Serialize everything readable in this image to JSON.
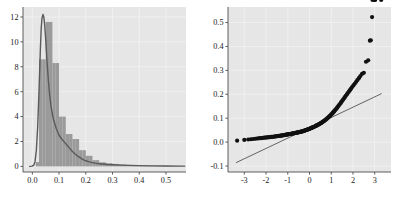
{
  "figure": {
    "background": "#ffffff",
    "panel_background": "#e6e6e6",
    "grid_color": "#f2f2f2",
    "axis_color": "#4d4d4d",
    "width": 394,
    "height": 200
  },
  "chart_data": [
    {
      "id": "density-histogram",
      "type": "area",
      "title": "",
      "xlabel": "",
      "ylabel": "",
      "xlim": [
        -0.035,
        0.575
      ],
      "ylim": [
        -0.45,
        12.8
      ],
      "xticks": [
        "0.0",
        "0.1",
        "0.2",
        "0.3",
        "0.4",
        "0.5"
      ],
      "xtick_values": [
        0.0,
        0.1,
        0.2,
        0.3,
        0.4,
        0.5
      ],
      "yticks": [
        "0",
        "2",
        "4",
        "6",
        "8",
        "10",
        "12"
      ],
      "ytick_values": [
        0,
        2,
        4,
        6,
        8,
        10,
        12
      ],
      "grid": true,
      "legend": "none",
      "series": [
        {
          "name": "histogram",
          "kind": "bar",
          "color": "#9a9a9a",
          "bin_width": 0.0125,
          "bin_left_edges": [
            0.0125,
            0.025,
            0.0375,
            0.05,
            0.0625,
            0.075,
            0.0875,
            0.1,
            0.1125,
            0.125,
            0.1375,
            0.15,
            0.1625,
            0.175,
            0.1875,
            0.2,
            0.2125,
            0.225,
            0.2375,
            0.25,
            0.2625,
            0.275,
            0.2875,
            0.3,
            0.3125,
            0.325,
            0.3375,
            0.35,
            0.3625,
            0.375,
            0.3875,
            0.4,
            0.4125,
            0.425,
            0.4375,
            0.45,
            0.4625,
            0.475,
            0.4875,
            0.5,
            0.5125,
            0.525,
            0.5375,
            0.55
          ],
          "values": [
            0.35,
            8.6,
            8.6,
            11.6,
            11.6,
            8.3,
            8.3,
            4.0,
            4.0,
            2.6,
            2.6,
            2.2,
            2.2,
            1.3,
            1.3,
            0.85,
            0.85,
            0.5,
            0.5,
            0.33,
            0.33,
            0.26,
            0.26,
            0.2,
            0.2,
            0.16,
            0.16,
            0.12,
            0.12,
            0.1,
            0.1,
            0.08,
            0.08,
            0.06,
            0.06,
            0.05,
            0.05,
            0.04,
            0.04,
            0.03,
            0.03,
            0.02,
            0.02,
            0.01
          ]
        },
        {
          "name": "kernel density",
          "kind": "line",
          "color": "#5a5a5a",
          "line_width": 1.4,
          "x": [
            -0.01,
            0.0,
            0.005,
            0.01,
            0.015,
            0.02,
            0.025,
            0.03,
            0.033,
            0.036,
            0.04,
            0.043,
            0.046,
            0.05,
            0.055,
            0.06,
            0.065,
            0.07,
            0.075,
            0.08,
            0.09,
            0.1,
            0.11,
            0.12,
            0.13,
            0.14,
            0.15,
            0.16,
            0.17,
            0.18,
            0.19,
            0.2,
            0.21,
            0.22,
            0.24,
            0.26,
            0.28,
            0.3,
            0.33,
            0.36,
            0.4,
            0.45,
            0.5,
            0.55,
            0.57
          ],
          "y": [
            0.0,
            0.02,
            0.1,
            0.38,
            1.3,
            3.2,
            6.1,
            9.4,
            11.0,
            11.9,
            12.2,
            12.0,
            11.4,
            10.2,
            8.4,
            6.9,
            5.7,
            4.8,
            4.2,
            3.7,
            3.0,
            2.5,
            2.2,
            1.95,
            1.7,
            1.45,
            1.2,
            1.0,
            0.82,
            0.68,
            0.55,
            0.45,
            0.38,
            0.32,
            0.24,
            0.19,
            0.15,
            0.13,
            0.1,
            0.08,
            0.06,
            0.04,
            0.03,
            0.02,
            0.02
          ]
        }
      ]
    },
    {
      "id": "normal-qq-plot",
      "type": "scatter",
      "title": "",
      "xlabel": "",
      "ylabel": "",
      "xlim": [
        -3.75,
        3.75
      ],
      "ylim": [
        -0.125,
        0.565
      ],
      "xticks": [
        "-3",
        "-2",
        "-1",
        "0",
        "1",
        "2",
        "3"
      ],
      "xtick_values": [
        -3,
        -2,
        -1,
        0,
        1,
        2,
        3
      ],
      "yticks": [
        "-0.1",
        "0.0",
        "0.1",
        "0.2",
        "0.3",
        "0.4",
        "0.5"
      ],
      "ytick_values": [
        -0.1,
        0.0,
        0.1,
        0.2,
        0.3,
        0.4,
        0.5
      ],
      "grid": true,
      "legend": "none",
      "point_color": "#111111",
      "point_size": 2.1,
      "reference_line": {
        "name": "qq reference line",
        "color": "#555555",
        "line_width": 0.9,
        "x": [
          -3.38,
          3.32
        ],
        "y": [
          -0.086,
          0.203
        ]
      },
      "points": {
        "x": [
          -3.33,
          -3.0,
          -2.82,
          -2.7,
          -2.6,
          -2.5,
          -2.42,
          -2.34,
          -2.27,
          -2.2,
          -2.14,
          -2.08,
          -2.02,
          -1.96,
          -1.91,
          -1.86,
          -1.81,
          -1.76,
          -1.72,
          -1.67,
          -1.63,
          -1.59,
          -1.55,
          -1.51,
          -1.47,
          -1.44,
          -1.4,
          -1.36,
          -1.33,
          -1.29,
          -1.26,
          -1.23,
          -1.19,
          -1.16,
          -1.13,
          -1.1,
          -1.07,
          -1.04,
          -1.01,
          -0.98,
          -0.95,
          -0.92,
          -0.89,
          -0.86,
          -0.83,
          -0.81,
          -0.78,
          -0.75,
          -0.72,
          -0.7,
          -0.67,
          -0.64,
          -0.62,
          -0.59,
          -0.57,
          -0.54,
          -0.51,
          -0.49,
          -0.46,
          -0.44,
          -0.41,
          -0.39,
          -0.36,
          -0.34,
          -0.31,
          -0.29,
          -0.26,
          -0.24,
          -0.21,
          -0.19,
          -0.17,
          -0.14,
          -0.12,
          -0.09,
          -0.07,
          -0.05,
          -0.02,
          0.0,
          0.02,
          0.05,
          0.07,
          0.09,
          0.12,
          0.14,
          0.17,
          0.19,
          0.21,
          0.24,
          0.26,
          0.29,
          0.31,
          0.34,
          0.36,
          0.39,
          0.41,
          0.44,
          0.46,
          0.49,
          0.51,
          0.54,
          0.57,
          0.59,
          0.62,
          0.64,
          0.67,
          0.7,
          0.72,
          0.75,
          0.78,
          0.81,
          0.83,
          0.86,
          0.89,
          0.92,
          0.95,
          0.98,
          1.01,
          1.04,
          1.07,
          1.1,
          1.13,
          1.16,
          1.19,
          1.23,
          1.26,
          1.29,
          1.33,
          1.36,
          1.4,
          1.44,
          1.47,
          1.51,
          1.55,
          1.59,
          1.63,
          1.67,
          1.72,
          1.76,
          1.81,
          1.86,
          1.91,
          1.96,
          2.02,
          2.08,
          2.14,
          2.2,
          2.27,
          2.34,
          2.42,
          2.5,
          2.6,
          2.7,
          2.78,
          2.82,
          2.88,
          2.9,
          3.0,
          3.02,
          3.3
        ],
        "y": [
          0.006,
          0.009,
          0.011,
          0.012,
          0.013,
          0.014,
          0.015,
          0.016,
          0.0165,
          0.017,
          0.018,
          0.0185,
          0.019,
          0.0195,
          0.02,
          0.0205,
          0.021,
          0.0215,
          0.022,
          0.0225,
          0.023,
          0.0235,
          0.024,
          0.0245,
          0.025,
          0.0255,
          0.026,
          0.0265,
          0.027,
          0.0275,
          0.028,
          0.0285,
          0.029,
          0.0295,
          0.03,
          0.0305,
          0.031,
          0.0315,
          0.032,
          0.0325,
          0.033,
          0.0335,
          0.034,
          0.0345,
          0.035,
          0.0355,
          0.036,
          0.0365,
          0.037,
          0.0375,
          0.038,
          0.0385,
          0.039,
          0.0395,
          0.04,
          0.0405,
          0.041,
          0.0415,
          0.042,
          0.0425,
          0.043,
          0.0435,
          0.044,
          0.0448,
          0.0455,
          0.0462,
          0.047,
          0.0478,
          0.0485,
          0.0493,
          0.05,
          0.0508,
          0.0516,
          0.0524,
          0.0532,
          0.054,
          0.0549,
          0.0557,
          0.0566,
          0.0575,
          0.0584,
          0.0593,
          0.0602,
          0.0612,
          0.0622,
          0.0632,
          0.0642,
          0.0653,
          0.0664,
          0.0675,
          0.0686,
          0.0698,
          0.071,
          0.0722,
          0.0735,
          0.0748,
          0.0761,
          0.0775,
          0.0789,
          0.0804,
          0.0819,
          0.0835,
          0.0851,
          0.0868,
          0.0886,
          0.0904,
          0.0923,
          0.0943,
          0.0963,
          0.0985,
          0.1007,
          0.103,
          0.1054,
          0.1079,
          0.1105,
          0.1132,
          0.116,
          0.1189,
          0.1219,
          0.125,
          0.1283,
          0.1317,
          0.1352,
          0.1389,
          0.1427,
          0.1466,
          0.1507,
          0.1549,
          0.1593,
          0.1638,
          0.1685,
          0.1733,
          0.1782,
          0.1833,
          0.1885,
          0.1939,
          0.1995,
          0.2052,
          0.2111,
          0.2172,
          0.2235,
          0.2301,
          0.2369,
          0.244,
          0.2514,
          0.2591,
          0.2672,
          0.276,
          0.2857,
          0.2897,
          0.336,
          0.342,
          0.424,
          0.426,
          0.523
        ]
      }
    }
  ]
}
